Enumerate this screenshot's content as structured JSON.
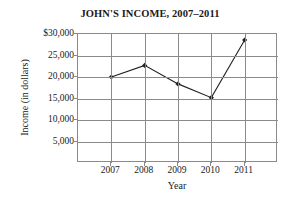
{
  "chart_data": {
    "type": "line",
    "title": "JOHN'S INCOME, 2007–2011",
    "xlabel": "Year",
    "ylabel": "Income (in dollars)",
    "categories": [
      "2007",
      "2008",
      "2009",
      "2010",
      "2011"
    ],
    "values": [
      20000,
      22700,
      18400,
      15200,
      28600
    ],
    "series": [
      {
        "name": "John's income",
        "values": [
          20000,
          22700,
          18400,
          15200,
          28600
        ]
      }
    ],
    "ylim": [
      0,
      30000
    ],
    "ytick_values": [
      30000,
      25000,
      20000,
      15000,
      10000,
      5000
    ],
    "ytick_labels": [
      "$30,000",
      "25,000",
      "20,000",
      "15,000",
      "10,000",
      "5,000"
    ],
    "xtick_labels": [
      "2007",
      "2008",
      "2009",
      "2010",
      "2011"
    ],
    "grid": "both",
    "legend": "none",
    "marker": "filled-diamond",
    "line_color": "#202020",
    "grid_color": "#8a8a8a",
    "background_color": "#ffffff"
  }
}
